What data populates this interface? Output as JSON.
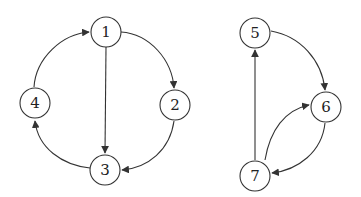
{
  "diagram": {
    "type": "directed-graph",
    "node_radius": 15,
    "colors": {
      "stroke": "#333333",
      "text": "#222222",
      "background": "#ffffff"
    },
    "nodes": [
      {
        "id": "1",
        "label": "1",
        "x": 106,
        "y": 32
      },
      {
        "id": "2",
        "label": "2",
        "x": 175,
        "y": 105
      },
      {
        "id": "3",
        "label": "3",
        "x": 105,
        "y": 170
      },
      {
        "id": "4",
        "label": "4",
        "x": 35,
        "y": 103
      },
      {
        "id": "5",
        "label": "5",
        "x": 255,
        "y": 33
      },
      {
        "id": "6",
        "label": "6",
        "x": 326,
        "y": 107
      },
      {
        "id": "7",
        "label": "7",
        "x": 255,
        "y": 176
      }
    ],
    "edges": [
      {
        "from": "1",
        "to": "2",
        "shape": "arc"
      },
      {
        "from": "1",
        "to": "3",
        "shape": "straight"
      },
      {
        "from": "2",
        "to": "3",
        "shape": "arc"
      },
      {
        "from": "3",
        "to": "4",
        "shape": "arc"
      },
      {
        "from": "4",
        "to": "1",
        "shape": "arc"
      },
      {
        "from": "5",
        "to": "6",
        "shape": "arc"
      },
      {
        "from": "6",
        "to": "7",
        "shape": "arc"
      },
      {
        "from": "7",
        "to": "6",
        "shape": "arc"
      },
      {
        "from": "7",
        "to": "5",
        "shape": "straight"
      }
    ]
  }
}
